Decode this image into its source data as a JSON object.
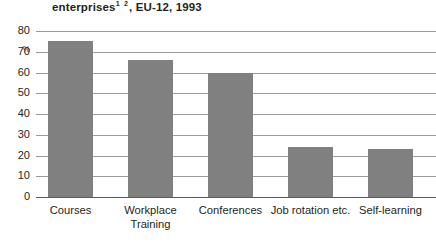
{
  "chart_data": {
    "type": "bar",
    "title_main": "enterprises",
    "title_footnotes": "1 2",
    "title_rest": ", EU-12, 1993",
    "subtitle": "",
    "xlabel": "",
    "ylabel": "%",
    "ylim": [
      0,
      80
    ],
    "yticks": [
      80,
      70,
      60,
      50,
      40,
      30,
      20,
      10,
      0
    ],
    "ytick_labels": [
      "80",
      "70",
      "60",
      "50",
      "40",
      "30",
      "20",
      "10",
      "0"
    ],
    "grid": true,
    "legend": false,
    "legend_position": "none",
    "bar_color": "#808080",
    "categories": [
      "Courses",
      "Workplace Training",
      "Conferences",
      "Job rotation etc.",
      "Self-learning"
    ],
    "category_lines": [
      [
        "Courses"
      ],
      [
        "Workplace",
        "Training"
      ],
      [
        "Conferences"
      ],
      [
        "Job rotation etc."
      ],
      [
        "Self-learning"
      ]
    ],
    "values": [
      75,
      66,
      60,
      24,
      23
    ]
  },
  "axis": {
    "unit_label": "%"
  }
}
